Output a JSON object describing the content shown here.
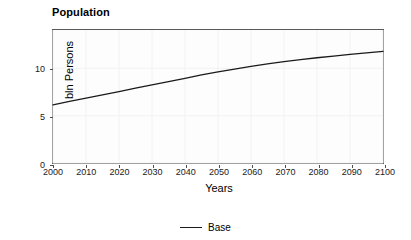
{
  "chart_data": {
    "type": "line",
    "title": "Population",
    "xlabel": "Years",
    "ylabel": "bln Persons",
    "xlim": [
      2000,
      2100
    ],
    "ylim": [
      0,
      14.05
    ],
    "grid": true,
    "legend_position": "bottom",
    "x_ticks": [
      2000,
      2010,
      2020,
      2030,
      2040,
      2050,
      2060,
      2070,
      2080,
      2090,
      2100
    ],
    "x_tick_labels": [
      "2000",
      "2010",
      "2020",
      "2030",
      "2040",
      "2050",
      "2060",
      "2070",
      "2080",
      "2090",
      "2100"
    ],
    "y_ticks": [
      0,
      5,
      10
    ],
    "y_tick_labels": [
      "0",
      "5",
      "10"
    ],
    "line_color": "#1a1a1a",
    "panel_background": "#fdfdfd",
    "grid_color": "#f2f2f2",
    "series": [
      {
        "name": "Base",
        "x": [
          2000,
          2005,
          2010,
          2015,
          2020,
          2025,
          2030,
          2035,
          2040,
          2045,
          2050,
          2055,
          2060,
          2065,
          2070,
          2075,
          2080,
          2085,
          2090,
          2095,
          2100
        ],
        "values": [
          6.15,
          6.5,
          6.85,
          7.2,
          7.55,
          7.9,
          8.25,
          8.6,
          8.95,
          9.3,
          9.62,
          9.92,
          10.2,
          10.46,
          10.7,
          10.92,
          11.12,
          11.3,
          11.48,
          11.64,
          11.8
        ]
      }
    ]
  },
  "legend": {
    "entries": [
      {
        "label": "Base",
        "color": "#1a1a1a"
      }
    ]
  }
}
